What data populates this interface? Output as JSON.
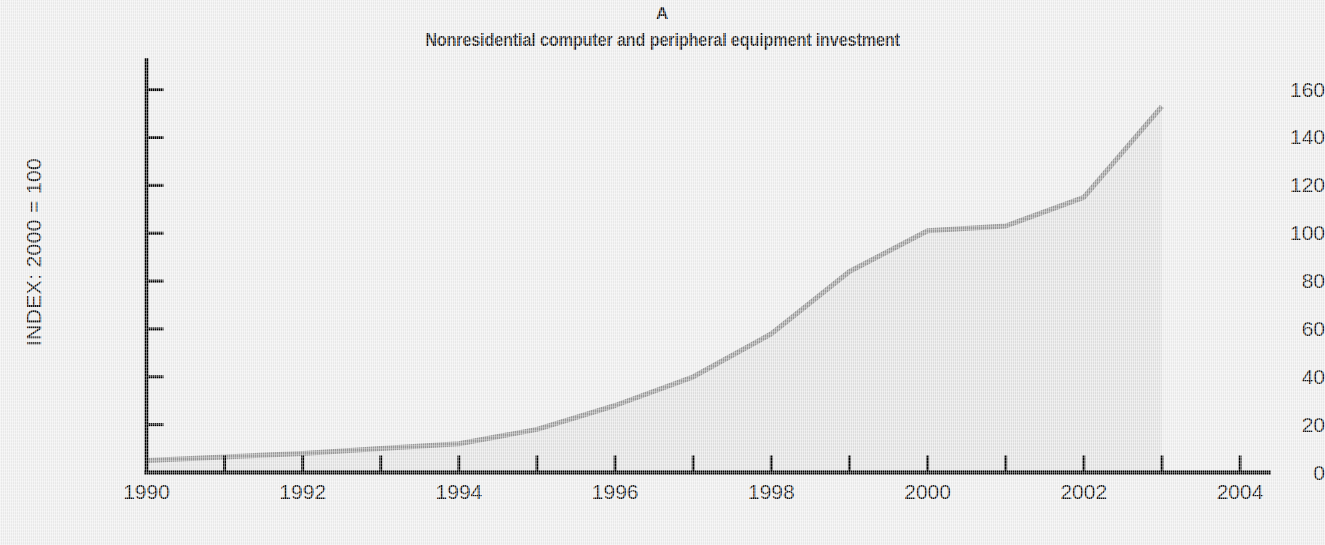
{
  "figure": {
    "panel_letter": "A",
    "title": "Nonresidential computer and peripheral equipment investment",
    "background_color": "#eeeeee",
    "area_fill_color": "#e2e2e2",
    "line_color": "#9a9a9a",
    "axis_color": "#000000"
  },
  "chart_data": {
    "type": "area",
    "title": "Nonresidential computer and peripheral equipment investment",
    "subtitle": "A",
    "xlabel": "",
    "ylabel": "INDEX: 2000 = 100",
    "x": [
      1990,
      1991,
      1992,
      1993,
      1994,
      1995,
      1996,
      1997,
      1998,
      1999,
      2000,
      2001,
      2002,
      2003
    ],
    "values": [
      5,
      6.5,
      8,
      10,
      12,
      18,
      28,
      40,
      58,
      84,
      101,
      103,
      115,
      153
    ],
    "series": [
      {
        "name": "Nonresidential computer and peripheral equipment investment",
        "values": [
          5,
          6.5,
          8,
          10,
          12,
          18,
          28,
          40,
          58,
          84,
          101,
          103,
          115,
          153
        ]
      }
    ],
    "xlim": [
      1990,
      2004
    ],
    "ylim": [
      0,
      170
    ],
    "ytick_values": [
      0,
      20,
      40,
      60,
      80,
      100,
      120,
      140,
      160
    ],
    "ytick_labels": [
      "0",
      "20",
      "40",
      "60",
      "80",
      "100",
      "120",
      "140",
      "160"
    ],
    "xtick_values": [
      1990,
      1991,
      1992,
      1993,
      1994,
      1995,
      1996,
      1997,
      1998,
      1999,
      2000,
      2001,
      2002,
      2003,
      2004
    ],
    "xtick_labels": [
      "1990",
      "",
      "1992",
      "",
      "1994",
      "",
      "1996",
      "",
      "1998",
      "",
      "2000",
      "",
      "2002",
      "",
      "2004"
    ],
    "xtick_labels_shown": [
      "1990",
      "1992",
      "1994",
      "1996",
      "1998",
      "2000",
      "2002",
      "2004"
    ],
    "grid": false,
    "legend": false,
    "tick_direction": "in",
    "fill_to_zero": true
  }
}
